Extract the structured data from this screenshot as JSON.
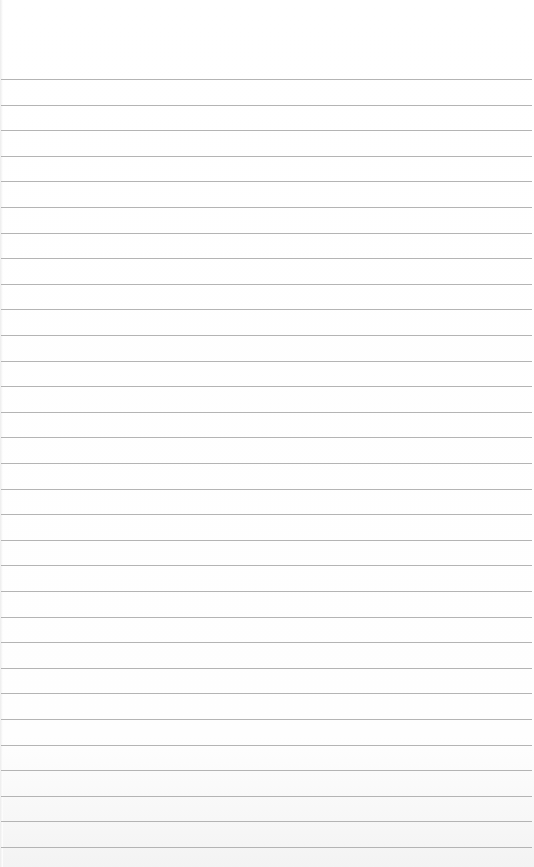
{
  "paper": {
    "type": "ruled-notebook-page",
    "line_count": 31,
    "first_line_y": 79,
    "line_spacing": 25.6,
    "line_color": "#b4b4b4",
    "background_color": "#ffffff"
  }
}
